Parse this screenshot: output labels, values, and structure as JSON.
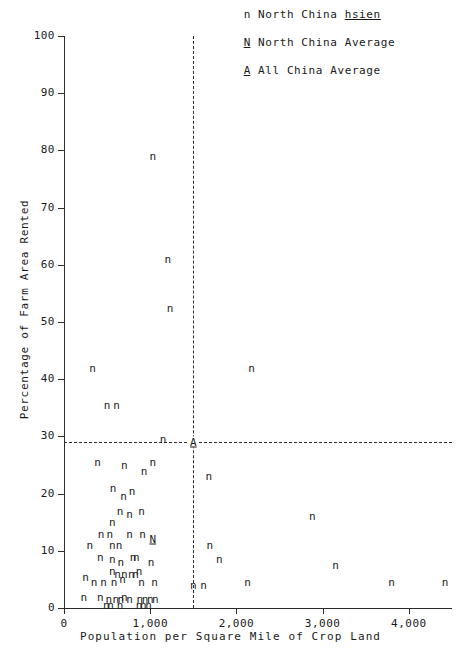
{
  "legend": {
    "items": [
      {
        "key": "n",
        "underlined": false,
        "label_pre": "North China ",
        "label_em": "hsien",
        "label_post": ""
      },
      {
        "key": "N",
        "underlined": true,
        "label_pre": "North China Average",
        "label_em": "",
        "label_post": ""
      },
      {
        "key": "A",
        "underlined": true,
        "label_pre": "All China Average",
        "label_em": "",
        "label_post": ""
      }
    ]
  },
  "axes": {
    "y_title": "Percentage of Farm Area Rented",
    "x_title": "Population per Square Mile of Crop Land",
    "y_ticks": [
      "0",
      "10",
      "20",
      "30",
      "40",
      "50",
      "60",
      "70",
      "80",
      "90",
      "100"
    ],
    "x_ticks": [
      "0",
      "1,000",
      "2,000",
      "3,000",
      "4,000"
    ]
  },
  "chart_data": {
    "type": "scatter",
    "title": "",
    "xlabel": "Population per Square Mile of Crop Land",
    "ylabel": "Percentage of Farm Area Rented",
    "xlim": [
      0,
      4500
    ],
    "ylim": [
      0,
      100
    ],
    "grid": false,
    "legend_position": "top-right",
    "reference_lines": [
      {
        "orientation": "horizontal",
        "value": 29,
        "style": "dashed",
        "label": "All China Average"
      },
      {
        "orientation": "vertical",
        "value": 1500,
        "style": "dashed",
        "label": "All China Average"
      }
    ],
    "series": [
      {
        "name": "North China hsien",
        "marker": "n",
        "points": [
          [
            1030,
            79.0
          ],
          [
            1205,
            61.0
          ],
          [
            1230,
            52.5
          ],
          [
            330,
            42.0
          ],
          [
            2175,
            42.0
          ],
          [
            500,
            35.5
          ],
          [
            610,
            35.5
          ],
          [
            1150,
            29.5
          ],
          [
            390,
            25.5
          ],
          [
            700,
            25.0
          ],
          [
            930,
            24.0
          ],
          [
            1030,
            25.5
          ],
          [
            1680,
            23.0
          ],
          [
            570,
            21.0
          ],
          [
            690,
            19.5
          ],
          [
            790,
            20.5
          ],
          [
            650,
            17.0
          ],
          [
            760,
            16.5
          ],
          [
            900,
            17.0
          ],
          [
            2880,
            16.0
          ],
          [
            560,
            15.0
          ],
          [
            430,
            13.0
          ],
          [
            530,
            13.0
          ],
          [
            760,
            13.0
          ],
          [
            910,
            13.0
          ],
          [
            300,
            11.0
          ],
          [
            560,
            11.0
          ],
          [
            640,
            11.0
          ],
          [
            1690,
            11.0
          ],
          [
            420,
            9.0
          ],
          [
            560,
            8.5
          ],
          [
            660,
            8.0
          ],
          [
            800,
            9.0
          ],
          [
            840,
            9.0
          ],
          [
            1010,
            8.0
          ],
          [
            1800,
            8.5
          ],
          [
            3150,
            7.5
          ],
          [
            560,
            6.5
          ],
          [
            620,
            6.0
          ],
          [
            700,
            6.0
          ],
          [
            780,
            6.0
          ],
          [
            830,
            6.0
          ],
          [
            870,
            6.5
          ],
          [
            250,
            5.5
          ],
          [
            350,
            4.5
          ],
          [
            460,
            4.5
          ],
          [
            580,
            4.5
          ],
          [
            680,
            5.0
          ],
          [
            900,
            4.5
          ],
          [
            1050,
            4.5
          ],
          [
            1500,
            4.0
          ],
          [
            1620,
            4.0
          ],
          [
            2130,
            4.5
          ],
          [
            3800,
            4.5
          ],
          [
            4420,
            4.5
          ],
          [
            230,
            2.0
          ],
          [
            420,
            2.0
          ],
          [
            520,
            1.5
          ],
          [
            600,
            1.5
          ],
          [
            660,
            1.5
          ],
          [
            700,
            2.0
          ],
          [
            760,
            1.5
          ],
          [
            880,
            1.5
          ],
          [
            940,
            1.5
          ],
          [
            1000,
            1.5
          ],
          [
            1060,
            1.5
          ],
          [
            490,
            0.6
          ],
          [
            540,
            0.6
          ],
          [
            650,
            0.6
          ],
          [
            870,
            0.6
          ],
          [
            920,
            0.6
          ],
          [
            980,
            0.6
          ]
        ]
      },
      {
        "name": "North China Average",
        "marker": "N",
        "points": [
          [
            1030,
            12.0
          ]
        ]
      },
      {
        "name": "All China Average",
        "marker": "A",
        "points": [
          [
            1500,
            29.0
          ]
        ]
      }
    ]
  }
}
